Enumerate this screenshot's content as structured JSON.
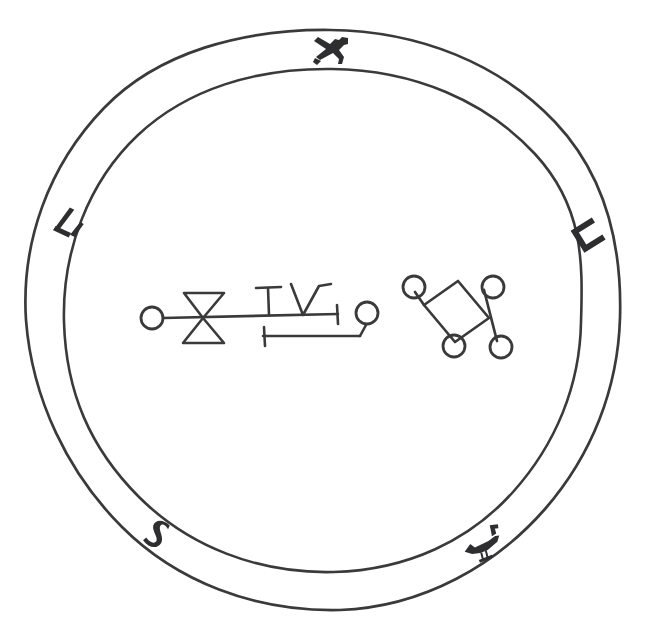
{
  "artwork": {
    "kind": "magic-seal",
    "title": "Seal of a Spirit",
    "medium": "pen-and-ink line drawing",
    "background_color": "#ffffff",
    "ink_color": "#3a3a3c",
    "fill_color": "#2e2e30",
    "canvas": {
      "width": 648,
      "height": 640
    }
  },
  "ring": {
    "name": "outer annular band",
    "center": {
      "x": 322,
      "y": 320
    },
    "outer_circle": {
      "rx": 299,
      "ry": 290,
      "stroke_width": 2.6
    },
    "inner_circle": {
      "rx": 259,
      "ry": 252,
      "stroke_width": 2.6
    },
    "band_thickness": 38,
    "hand_drawn": true
  },
  "ring_glyphs": [
    {
      "name": "glyph-top",
      "semantic": "deer-like-hebrew-letter",
      "position": "top",
      "angle_deg": 270,
      "center": {
        "x": 330,
        "y": 50
      },
      "rotation_deg": 0
    },
    {
      "name": "glyph-upper-left",
      "semantic": "hook-bracket-letter",
      "position": "upper-left",
      "angle_deg": 200,
      "center": {
        "x": 69,
        "y": 224
      },
      "rotation_deg": -62
    },
    {
      "name": "glyph-upper-right",
      "semantic": "cup-u-letter",
      "position": "upper-right",
      "angle_deg": 340,
      "center": {
        "x": 588,
        "y": 234
      },
      "rotation_deg": 58
    },
    {
      "name": "glyph-lower-left",
      "semantic": "s-curve-letter",
      "position": "lower-left",
      "angle_deg": 145,
      "center": {
        "x": 157,
        "y": 532
      },
      "rotation_deg": 38
    },
    {
      "name": "glyph-lower-right",
      "semantic": "bird-like-letter",
      "position": "lower-right",
      "angle_deg": 40,
      "center": {
        "x": 484,
        "y": 546
      },
      "rotation_deg": -22
    }
  ],
  "center_sigils": [
    {
      "name": "sigil-left",
      "semantic": "linear-sigil-with-hourglass-and-crosses",
      "bounds": {
        "x": 138,
        "y": 278,
        "width": 240,
        "height": 66
      },
      "components": [
        "left-terminal-circle",
        "horizontal-baseline",
        "hourglass-bowtie",
        "t-cross-upright",
        "v-hook",
        "vertical-end-tick",
        "lower-offset-bar-with-tick",
        "right-terminal-circle"
      ]
    },
    {
      "name": "sigil-right",
      "semantic": "diamond-cross-sigil-with-four-rings",
      "bounds": {
        "x": 404,
        "y": 276,
        "width": 110,
        "height": 82
      },
      "components": [
        "upper-left-ring",
        "upper-right-ring",
        "lower-center-ring",
        "lower-right-ring",
        "diamond-body",
        "crossing-diagonal"
      ]
    }
  ]
}
